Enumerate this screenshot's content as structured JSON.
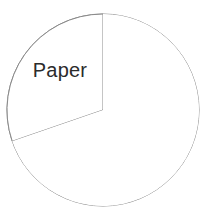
{
  "canvas": {
    "width": 205,
    "height": 218,
    "background": "#ffffff"
  },
  "style": {
    "stroke_color": "#8a8a8a",
    "stroke_width": 1,
    "slice_fill": "#ffffff",
    "label_color": "#2b2b2b",
    "label_font_size": 20
  },
  "geometry": {
    "center_x": 103,
    "center_y": 110,
    "radius": 96,
    "start_angle_deg": 90,
    "end_angle_deg": 199
  },
  "chart_data": {
    "type": "pie",
    "title": "",
    "subtitle": "",
    "xlabel": "",
    "ylabel": "",
    "grid": false,
    "legend_position": "none",
    "slices": [
      {
        "label": "Paper",
        "value": 30,
        "sweep_deg": 109,
        "start_angle_deg": 90,
        "end_angle_deg": 199,
        "fill": "#ffffff",
        "label_x": 60,
        "label_y": 72
      },
      {
        "label": "",
        "value": 70,
        "sweep_deg": 251,
        "start_angle_deg": 199,
        "end_angle_deg": 450,
        "fill": "#ffffff",
        "label_x": 0,
        "label_y": 0
      }
    ],
    "labels": [
      "Paper",
      ""
    ],
    "values": [
      30,
      70
    ],
    "annotations": []
  }
}
